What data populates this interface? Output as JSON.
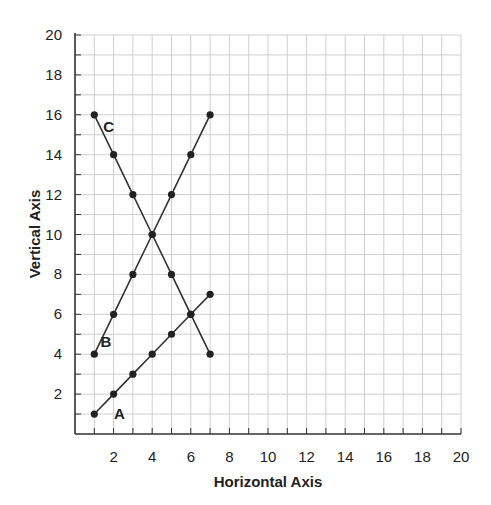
{
  "chart_data": {
    "type": "line",
    "title": "",
    "xlabel": "Horizontal Axis",
    "ylabel": "Vertical Axis",
    "xlim": [
      0,
      20
    ],
    "ylim": [
      0,
      20
    ],
    "grid": true,
    "grid_minor_step": 1,
    "x_ticks": [
      2,
      4,
      6,
      8,
      10,
      12,
      14,
      16,
      18,
      20
    ],
    "y_ticks": [
      2,
      4,
      6,
      8,
      10,
      12,
      14,
      16,
      18,
      20
    ],
    "legend": "none (inline series labels)",
    "series": [
      {
        "name": "A",
        "label_pos": [
          2.3,
          1.0
        ],
        "points": [
          [
            1,
            1
          ],
          [
            2,
            2
          ],
          [
            3,
            3
          ],
          [
            4,
            4
          ],
          [
            5,
            5
          ],
          [
            6,
            6
          ],
          [
            7,
            7
          ]
        ]
      },
      {
        "name": "B",
        "label_pos": [
          1.6,
          4.6
        ],
        "points": [
          [
            1,
            4
          ],
          [
            2,
            6
          ],
          [
            3,
            8
          ],
          [
            4,
            10
          ],
          [
            5,
            12
          ],
          [
            6,
            14
          ],
          [
            7,
            16
          ]
        ]
      },
      {
        "name": "C",
        "label_pos": [
          1.75,
          15.4
        ],
        "points": [
          [
            1,
            16
          ],
          [
            2,
            14
          ],
          [
            3,
            12
          ],
          [
            4,
            10
          ],
          [
            5,
            8
          ],
          [
            6,
            6
          ],
          [
            7,
            4
          ]
        ]
      }
    ],
    "colors": {
      "line": "#333333",
      "marker": "#222222",
      "grid": "#cfcfcf",
      "axis": "#333333"
    }
  }
}
